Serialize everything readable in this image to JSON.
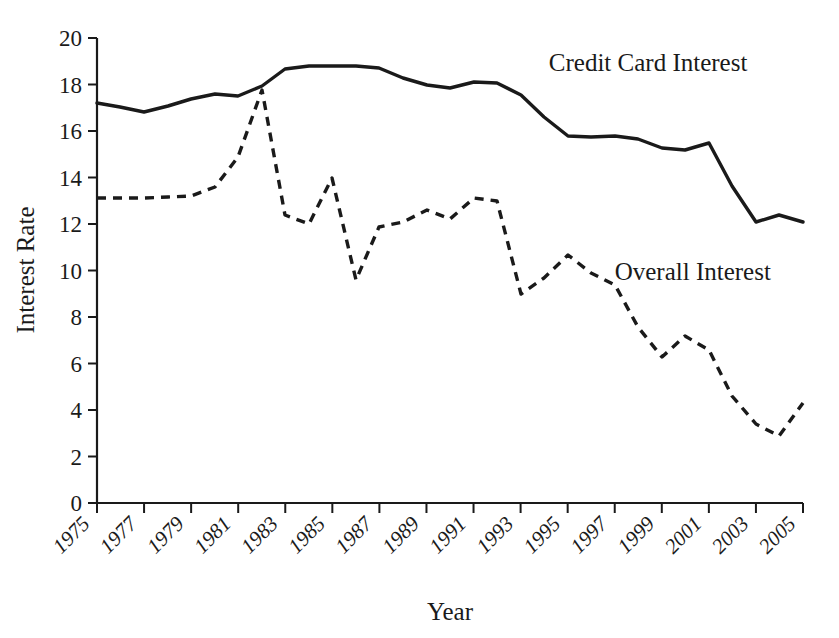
{
  "chart_data": {
    "type": "line",
    "title": "",
    "xlabel": "Year",
    "ylabel": "Interest Rate",
    "xlim": [
      1975,
      2005
    ],
    "ylim": [
      0,
      20
    ],
    "grid": false,
    "legend_position": "inline-annotation",
    "yticks": [
      0,
      2,
      4,
      6,
      8,
      10,
      12,
      14,
      16,
      18,
      20
    ],
    "ytick_labels": [
      "0",
      "2",
      "4",
      "6",
      "8",
      "10",
      "12",
      "14",
      "16",
      "18",
      "20"
    ],
    "xticks": [
      1975,
      1977,
      1979,
      1981,
      1983,
      1985,
      1987,
      1989,
      1991,
      1993,
      1995,
      1997,
      1999,
      2001,
      2003,
      2005
    ],
    "xtick_labels": [
      "1975",
      "1977",
      "1979",
      "1981",
      "1983",
      "1985",
      "1987",
      "1989",
      "1991",
      "1993",
      "1995",
      "1997",
      "1999",
      "2001",
      "2003",
      "2005"
    ],
    "x": [
      1975,
      1976,
      1977,
      1978,
      1979,
      1980,
      1981,
      1982,
      1983,
      1984,
      1985,
      1986,
      1987,
      1988,
      1989,
      1990,
      1991,
      1992,
      1993,
      1994,
      1995,
      1996,
      1997,
      1998,
      1999,
      2000,
      2001,
      2002,
      2003,
      2004,
      2005
    ],
    "series": [
      {
        "name": "Credit Card Interest",
        "style": "solid",
        "color": "#1a1a1a",
        "label_x": 1994.2,
        "label_y": 18.6,
        "values": [
          17.2,
          17.0,
          16.8,
          17.0,
          17.3,
          17.45,
          17.4,
          17.6,
          18.1,
          18.7,
          18.7,
          18.7,
          18.7,
          18.6,
          18.2,
          17.9,
          17.7,
          17.8,
          18.1,
          18.0,
          17.7,
          17.1,
          16.2,
          15.8,
          15.7,
          15.8,
          15.7,
          15.5,
          15.2,
          15.3,
          15.55
        ]
      },
      {
        "name": "Overall Interest",
        "style": "dashed",
        "color": "#1a1a1a",
        "label_x": 1997.0,
        "label_y": 9.6,
        "values": [
          13.1,
          13.1,
          13.1,
          13.15,
          13.2,
          13.5,
          14.6,
          15.9,
          17.8,
          15.0,
          12.0,
          12.4,
          14.0,
          13.0,
          11.0,
          9.6,
          10.4,
          12.1,
          12.2,
          12.1,
          12.6,
          12.8,
          13.2,
          13.2,
          12.6,
          11.0,
          9.4,
          9.0,
          10.0,
          10.7,
          10.6
        ]
      }
    ],
    "series_notes": {
      "credit_card_interest_extended": [
        17.2,
        17.0,
        16.8,
        17.0,
        17.3,
        17.45,
        17.4,
        17.6,
        18.1,
        18.7,
        18.7,
        18.7,
        18.7,
        18.6,
        18.2,
        17.9,
        17.7,
        17.8,
        18.1,
        18.0,
        17.7,
        17.1,
        16.2,
        15.8,
        15.7,
        15.8,
        15.7,
        15.5,
        15.2,
        15.3,
        15.55,
        15.5,
        13.5,
        12.1,
        12.4,
        12.1
      ],
      "overall_interest_extended": [
        13.1,
        13.1,
        13.1,
        13.15,
        13.2,
        13.5,
        14.6,
        15.9,
        17.8,
        15.0,
        12.0,
        12.4,
        14.0,
        13.0,
        11.0,
        9.6,
        10.4,
        12.1,
        12.2,
        12.1,
        12.6,
        12.8,
        13.2,
        13.2,
        12.6,
        11.0,
        9.4,
        9.0,
        10.0,
        10.7,
        10.6,
        9.2,
        7.6,
        6.6,
        6.2,
        6.8,
        7.2,
        6.6,
        5.2,
        3.9,
        2.9,
        3.4,
        4.3
      ]
    },
    "data_points": {
      "Credit Card Interest": [
        {
          "year": 1975,
          "value": 17.2
        },
        {
          "year": 1976,
          "value": 17.0
        },
        {
          "year": 1977,
          "value": 16.8
        },
        {
          "year": 1978,
          "value": 17.05
        },
        {
          "year": 1979,
          "value": 17.3
        },
        {
          "year": 1980,
          "value": 17.45
        },
        {
          "year": 1981,
          "value": 17.4
        },
        {
          "year": 1982,
          "value": 17.7
        },
        {
          "year": 1983,
          "value": 18.65
        },
        {
          "year": 1984,
          "value": 18.7
        },
        {
          "year": 1985,
          "value": 18.7
        },
        {
          "year": 1986,
          "value": 18.7
        },
        {
          "year": 1987,
          "value": 18.6
        },
        {
          "year": 1988,
          "value": 18.1
        },
        {
          "year": 1989,
          "value": 17.8
        },
        {
          "year": 1990,
          "value": 17.7
        },
        {
          "year": 1991,
          "value": 18.1
        },
        {
          "year": 1992,
          "value": 18.0
        },
        {
          "year": 1993,
          "value": 17.4
        },
        {
          "year": 1994,
          "value": 16.6
        },
        {
          "year": 1995,
          "value": 15.8
        },
        {
          "year": 1996,
          "value": 15.75
        },
        {
          "year": 1997,
          "value": 15.8
        },
        {
          "year": 1998,
          "value": 15.7
        },
        {
          "year": 1999,
          "value": 15.3
        },
        {
          "year": 2000,
          "value": 15.2
        },
        {
          "year": 2001,
          "value": 15.5
        },
        {
          "year": 2002,
          "value": 13.6
        },
        {
          "year": 2003,
          "value": 12.1
        },
        {
          "year": 2004,
          "value": 12.4
        },
        {
          "year": 2005,
          "value": 12.1
        }
      ],
      "Overall Interest": [
        {
          "year": 1975,
          "value": 13.1
        },
        {
          "year": 1976,
          "value": 13.1
        },
        {
          "year": 1977,
          "value": 13.1
        },
        {
          "year": 1978,
          "value": 13.15
        },
        {
          "year": 1979,
          "value": 13.2
        },
        {
          "year": 1980,
          "value": 13.6
        },
        {
          "year": 1981,
          "value": 14.9
        },
        {
          "year": 1982,
          "value": 17.75
        },
        {
          "year": 1983,
          "value": 12.4
        },
        {
          "year": 1984,
          "value": 12.0
        },
        {
          "year": 1985,
          "value": 14.0
        },
        {
          "year": 1986,
          "value": 9.6
        },
        {
          "year": 1987,
          "value": 11.9
        },
        {
          "year": 1988,
          "value": 12.1
        },
        {
          "year": 1989,
          "value": 12.6
        },
        {
          "year": 1990,
          "value": 12.2
        },
        {
          "year": 1991,
          "value": 13.1
        },
        {
          "year": 1992,
          "value": 13.0
        },
        {
          "year": 1993,
          "value": 9.0
        },
        {
          "year": 1994,
          "value": 9.7
        },
        {
          "year": 1995,
          "value": 10.7
        },
        {
          "year": 1996,
          "value": 9.9
        },
        {
          "year": 1997,
          "value": 9.4
        },
        {
          "year": 1998,
          "value": 7.6
        },
        {
          "year": 1999,
          "value": 6.3
        },
        {
          "year": 2000,
          "value": 7.2
        },
        {
          "year": 2001,
          "value": 6.6
        },
        {
          "year": 2002,
          "value": 4.6
        },
        {
          "year": 2003,
          "value": 3.4
        },
        {
          "year": 2004,
          "value": 2.9
        },
        {
          "year": 2005,
          "value": 4.3
        }
      ]
    },
    "path_solid": "97,103 120,107 144,112 168,106 191,99 215,94 238,96 262,86 285,69 309,66 332,66 356,66 379,68 403,78 427,85 450,88 474,82 497,83 521,95 544,117 568,136 591,137 615,136 638,139 662,148 685,150 709,143 732,186 756,222 779,215 803,222",
    "path_dashed": "97,198 120,198 144,198 168,197 191,196 215,187 238,157 262,90 285,215 309,224 332,178 356,280 379,227 403,222 427,210 450,219 474,198 497,201 521,294 544,278 568,255 591,273 615,285 638,327 662,357 685,336 709,350 732,396 756,424 779,436 803,403",
    "axis": {
      "x_left_px": 97,
      "x_right_px": 803,
      "y_bottom_px": 503,
      "y_top_px": 38
    }
  }
}
